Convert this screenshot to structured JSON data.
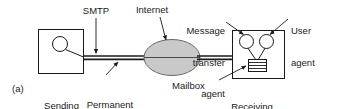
{
  "figure": {
    "panel_label": "(a)",
    "type": "email-architecture-diagram",
    "colors": {
      "stroke": "#1a1a1a",
      "cloud_fill": "#c9c9c9",
      "box_fill": "#ffffff",
      "text": "#1a1a1a",
      "background": "#ffffff"
    }
  },
  "labels": {
    "smtp": "SMTP",
    "internet": "Internet",
    "message_transfer_agent": "Message\ntransfer\nagent",
    "message_transfer_agent_lines": [
      "Message",
      "transfer",
      "agent"
    ],
    "user_agent": "User\nagent",
    "user_agent_lines": [
      "User",
      "agent"
    ],
    "sending_host": "Sending\nhost",
    "sending_host_lines": [
      "Sending",
      "host"
    ],
    "permanent_connection": "Permanent\nconnection",
    "permanent_connection_lines": [
      "Permanent",
      "connection"
    ],
    "mailbox": "Mailbox",
    "receiving_host": "Receiving\nhost",
    "receiving_host_lines": [
      "Receiving",
      "host"
    ]
  },
  "nodes": {
    "sending_host": {
      "shape": "rectangle",
      "contains": "user-agent-circle"
    },
    "internet": {
      "shape": "ellipse",
      "fill": "#c9c9c9"
    },
    "receiving_host": {
      "shape": "rectangle",
      "contains": [
        "message-transfer-agent-circle",
        "user-agent-circle",
        "mailbox-stack"
      ]
    }
  }
}
